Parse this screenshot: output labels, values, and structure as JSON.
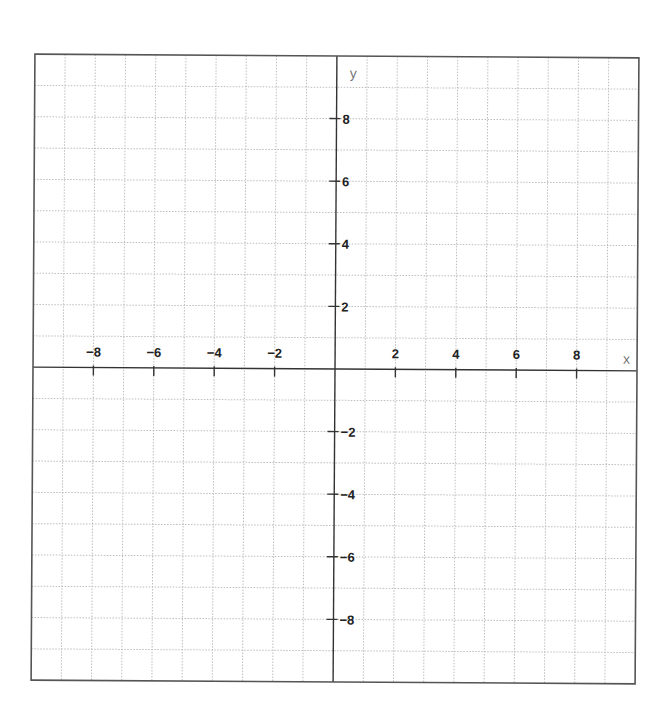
{
  "chart_data": {
    "type": "line",
    "title": "",
    "xlabel": "x",
    "ylabel": "y",
    "xlim": [
      -10,
      10
    ],
    "ylim": [
      -10,
      10
    ],
    "grid": true,
    "grid_step": 1,
    "x_ticks": [
      -8,
      -6,
      -4,
      -2,
      2,
      4,
      6,
      8
    ],
    "y_ticks": [
      8,
      6,
      4,
      2,
      -2,
      -4,
      -6,
      -8
    ],
    "x_tick_labels": [
      "−8",
      "−6",
      "−4",
      "−2",
      "2",
      "4",
      "6",
      "8"
    ],
    "y_tick_labels": [
      "8",
      "6",
      "4",
      "2",
      "−2",
      "−4",
      "−6",
      "−8"
    ],
    "series": [],
    "legend": null
  },
  "colors": {
    "frame": "#555555",
    "axis": "#333333",
    "grid": "#bdbdbd",
    "label": "#222222",
    "axis_name": "#777777"
  }
}
